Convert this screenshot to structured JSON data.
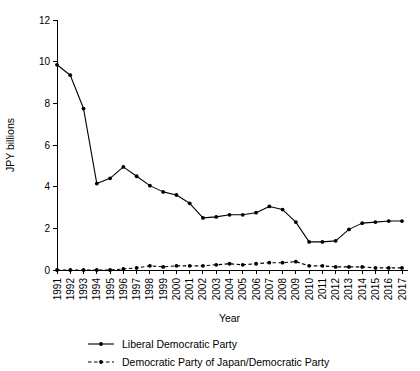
{
  "chart_data": {
    "type": "line",
    "title": "",
    "xlabel": "Year",
    "ylabel": "JPY billions",
    "xlim": [
      1991,
      2017
    ],
    "ylim": [
      0,
      12
    ],
    "grid": false,
    "legend_position": "bottom",
    "yticks": [
      "0",
      "2",
      "4",
      "6",
      "8",
      "10",
      "12"
    ],
    "ytick_values": [
      0,
      2,
      4,
      6,
      8,
      10,
      12
    ],
    "categories": [
      "1991",
      "1992",
      "1993",
      "1994",
      "1995",
      "1996",
      "1997",
      "1998",
      "1999",
      "2000",
      "2001",
      "2002",
      "2003",
      "2004",
      "2005",
      "2006",
      "2007",
      "2008",
      "2009",
      "2010",
      "2011",
      "2012",
      "2013",
      "2014",
      "2015",
      "2016",
      "2017"
    ],
    "series": [
      {
        "name": "Liberal Democratic Party",
        "style": "solid",
        "marker": "filled-circle",
        "color": "#000000",
        "values": [
          9.85,
          9.35,
          7.75,
          4.15,
          4.4,
          4.95,
          4.5,
          4.05,
          3.75,
          3.6,
          3.2,
          2.5,
          2.55,
          2.65,
          2.65,
          2.75,
          3.05,
          2.9,
          2.3,
          1.35,
          1.35,
          1.4,
          1.95,
          2.25,
          2.3,
          2.35,
          2.35
        ]
      },
      {
        "name": "Democratic Party of Japan/Democratic Party",
        "style": "dashed",
        "marker": "filled-circle",
        "color": "#000000",
        "values": [
          0.0,
          0.0,
          0.0,
          0.0,
          0.0,
          0.05,
          0.1,
          0.2,
          0.15,
          0.2,
          0.2,
          0.2,
          0.25,
          0.3,
          0.25,
          0.3,
          0.35,
          0.35,
          0.4,
          0.2,
          0.2,
          0.15,
          0.15,
          0.15,
          0.1,
          0.1,
          0.1
        ]
      }
    ],
    "legend": [
      {
        "label": "Liberal Democratic Party",
        "style": "solid"
      },
      {
        "label": "Democratic Party of Japan/Democratic Party",
        "style": "dashed"
      }
    ]
  }
}
